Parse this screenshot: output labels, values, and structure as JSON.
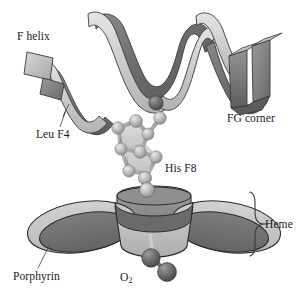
{
  "figure": {
    "background_color": "#ffffff",
    "width": 308,
    "height": 292
  },
  "labels": {
    "f_helix": "F helix",
    "leu_f4": "Leu F4",
    "fg_corner": "FG corner",
    "his_f8": "His F8",
    "heme": "Heme",
    "porphyrin": "Porphyrin",
    "o2": "O",
    "o2_subscript": "2"
  },
  "annotations": {
    "leader_lines": [
      {
        "name": "leu-f4-leader",
        "from": "Leu F4 label",
        "to": "helix ribbon terminus"
      },
      {
        "name": "porphyrin-leader",
        "from": "Porphyrin label",
        "to": "left pyrrole ring edge"
      }
    ],
    "brace": {
      "name": "heme-brace",
      "orientation": "right",
      "spans": "heme group",
      "label": "Heme"
    }
  },
  "structures": {
    "f_helix": {
      "name": "alpha-helix ribbon",
      "style": "twisted ribbon",
      "top_surface_color": "#c9c9c9",
      "shadow_surface_color": "#6f6f6f",
      "outline_color": "#3b3b3b",
      "turns": 3
    },
    "his_f8": {
      "name": "histidine imidazole ring",
      "style": "ball-and-stick",
      "atom_color": "#b6b6b6",
      "atom_highlight": "#dedede",
      "ring_fill": "#cfcfcf",
      "bond_color": "#9b9b9b",
      "atom_count": 9
    },
    "heme": {
      "name": "porphyrin ring with central iron",
      "pyrrole_outer_color": "#c2c2c2",
      "pyrrole_inner_color": "#6e6e6e",
      "central_cylinder_color": "#808080",
      "outline_color": "#2b2b2b",
      "pyrrole_count": 4,
      "iron_atom_color": "#9c9c9c"
    },
    "o2": {
      "name": "dioxygen molecule",
      "atom_color": "#6a6a6a",
      "atom_highlight": "#8e8e8e",
      "atom_count": 2
    }
  },
  "colors": {
    "text": "#1a1a22",
    "light_gray": "#c9c9c9",
    "mid_gray": "#9b9b9b",
    "dark_gray": "#6f6f6f",
    "outline": "#3b3b3b"
  }
}
